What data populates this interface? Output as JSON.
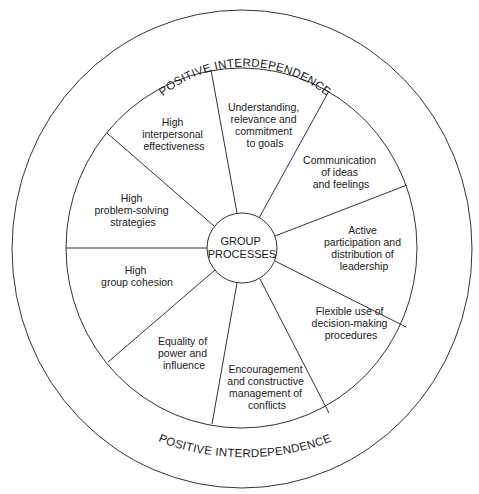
{
  "diagram": {
    "type": "concentric-wheel",
    "center": {
      "lines": [
        "GROUP",
        "PROCESSES"
      ]
    },
    "outer_ring": {
      "top_label": "POSITIVE INTERDEPENDENCE",
      "bottom_label": "POSITIVE INTERDEPENDENCE"
    },
    "segments": [
      {
        "id": "understanding",
        "lines": [
          "Understanding,",
          "relevance and",
          "commitment",
          "to goals"
        ]
      },
      {
        "id": "communication",
        "lines": [
          "Communication",
          "of ideas",
          "and feelings"
        ]
      },
      {
        "id": "participation",
        "lines": [
          "Active",
          "participation and",
          "distribution of",
          "leadership"
        ]
      },
      {
        "id": "decision-making",
        "lines": [
          "Flexible use of",
          "decision-making",
          "procedures"
        ]
      },
      {
        "id": "conflict",
        "lines": [
          "Encouragement",
          "and constructive",
          "management of",
          "conflicts"
        ]
      },
      {
        "id": "equality",
        "lines": [
          "Equality of",
          "power and",
          "influence"
        ]
      },
      {
        "id": "cohesion",
        "lines": [
          "High",
          "group cohesion"
        ]
      },
      {
        "id": "problem-solving",
        "lines": [
          "High",
          "problem-solving",
          "strategies"
        ]
      },
      {
        "id": "interpersonal",
        "lines": [
          "High",
          "interpersonal",
          "effectiveness"
        ]
      }
    ],
    "colors": {
      "line": "#333333",
      "text": "#1a1a1a",
      "background": "#ffffff"
    }
  }
}
